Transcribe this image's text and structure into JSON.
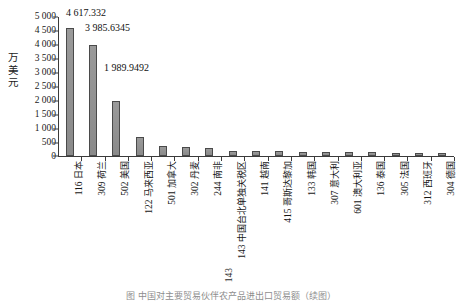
{
  "chart_data": {
    "type": "bar",
    "title": "",
    "xlabel": "",
    "ylabel": "万美元",
    "ylabel_chars": [
      "万",
      "美",
      "元"
    ],
    "ylim": [
      0,
      5000
    ],
    "ytick_labels": [
      "5 000",
      "4 500",
      "4 000",
      "3 500",
      "3 000",
      "2 500",
      "2 000",
      "1 500",
      "1 000",
      "500",
      "0"
    ],
    "ytick_values": [
      5000,
      4500,
      4000,
      3500,
      3000,
      2500,
      2000,
      1500,
      1000,
      500,
      0
    ],
    "grid": false,
    "legend": "none",
    "categories": [
      "116 日本",
      "309 荷兰",
      "502 美国",
      "122 马来西亚",
      "501 加拿大",
      "302 丹麦",
      "244 南非",
      "143 中国台北单独关税区",
      "141 越南",
      "415 哥斯达黎加",
      "133 韩国",
      "307 意大利",
      "601 澳大利亚",
      "136 泰国",
      "305 法国",
      "312 西班牙",
      "304 德国"
    ],
    "category_codes": [
      "116",
      "309",
      "502",
      "122",
      "501",
      "302",
      "244",
      "143",
      "141",
      "415",
      "133",
      "307",
      "601",
      "136",
      "305",
      "312",
      "304"
    ],
    "category_names": [
      "日本",
      "荷兰",
      "美国",
      "马来西亚",
      "加拿大",
      "丹麦",
      "南非",
      "中国台北单独关税区",
      "越南",
      "哥斯达黎加",
      "韩国",
      "意大利",
      "澳大利亚",
      "泰国",
      "法国",
      "西班牙",
      "德国"
    ],
    "values": [
      4617.332,
      3985.6345,
      1989.9492,
      690,
      350,
      318,
      272,
      196,
      180,
      168,
      155,
      148,
      138,
      130,
      122,
      112,
      104
    ],
    "data_labels": [
      {
        "index": 0,
        "text": "4 617.332"
      },
      {
        "index": 1,
        "text": "3 985.6345"
      },
      {
        "index": 2,
        "text": "1 989.9492"
      }
    ],
    "bar_color": "#8c8c8c",
    "bar_border_color": "#4a4a4a",
    "axis_color": "#3b3b3b"
  },
  "footer": {
    "page_number": "143",
    "caption": "图 中国对主要贸易伙伴农产品进出口贸易额（续图）"
  }
}
